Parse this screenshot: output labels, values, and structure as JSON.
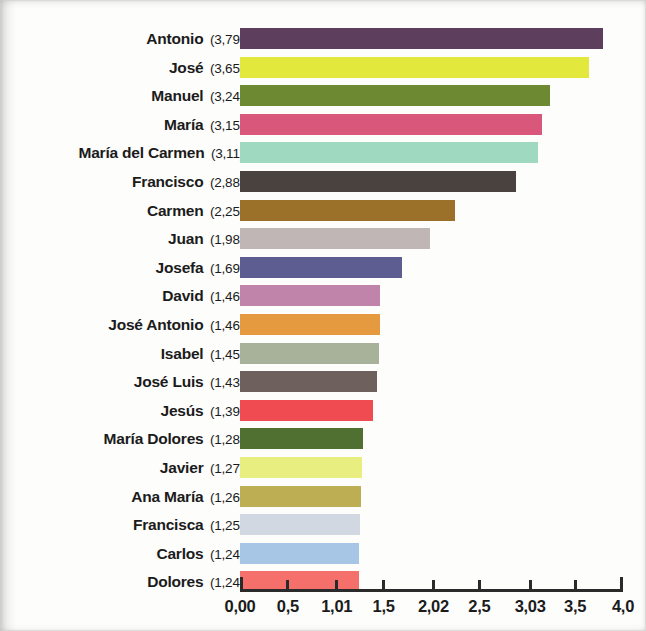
{
  "chart_data": {
    "type": "bar",
    "orientation": "horizontal",
    "title": "",
    "subtitle": "",
    "xlabel": "",
    "ylabel": "",
    "xlim": [
      0,
      4.0
    ],
    "grid": false,
    "legend": false,
    "decimal_separator": ",",
    "axis": {
      "tick_values": [
        0,
        0.5,
        1.01,
        1.5,
        2.02,
        2.5,
        3.03,
        3.5,
        4.0
      ],
      "tick_labels": [
        "0,00",
        "0,5",
        "1,01",
        "1,5",
        "2,02",
        "2,5",
        "3,03",
        "3,5",
        "4,0"
      ]
    },
    "categories": [
      "Antonio",
      "José",
      "Manuel",
      "María",
      "María del Carmen",
      "Francisco",
      "Carmen",
      "Juan",
      "Josefa",
      "David",
      "José Antonio",
      "Isabel",
      "José Luis",
      "Jesús",
      "María Dolores",
      "Javier",
      "Ana María",
      "Francisca",
      "Carlos",
      "Dolores"
    ],
    "values": [
      3.79,
      3.65,
      3.24,
      3.15,
      3.11,
      2.88,
      2.25,
      1.98,
      1.69,
      1.46,
      1.46,
      1.45,
      1.43,
      1.39,
      1.28,
      1.27,
      1.26,
      1.25,
      1.24,
      1.24
    ],
    "value_labels": [
      "3,79",
      "3,65",
      "3,24",
      "3,15",
      "3,11",
      "2,88",
      "2,25",
      "1,98",
      "1,69",
      "1,46",
      "1,46",
      "1,45",
      "1,43",
      "1,39",
      "1,28",
      "1,27",
      "1,26",
      "1,25",
      "1,24",
      "1,24"
    ],
    "colors": [
      "#5d3f5d",
      "#e2e83c",
      "#6d8a33",
      "#d8577a",
      "#9ed9c0",
      "#4a423e",
      "#9b7028",
      "#c0b6b6",
      "#5d5d91",
      "#c084aa",
      "#e59a3f",
      "#a8b29a",
      "#6e605c",
      "#ef4b51",
      "#4f7030",
      "#e8ee80",
      "#bdae53",
      "#d2d8e2",
      "#a7c6e6",
      "#f5706a"
    ],
    "rows": [
      {
        "name": "Antonio",
        "value": 3.79,
        "value_label": "3,79",
        "color": "#5d3f5d"
      },
      {
        "name": "José",
        "value": 3.65,
        "value_label": "3,65",
        "color": "#e2e83c"
      },
      {
        "name": "Manuel",
        "value": 3.24,
        "value_label": "3,24",
        "color": "#6d8a33"
      },
      {
        "name": "María",
        "value": 3.15,
        "value_label": "3,15",
        "color": "#d8577a"
      },
      {
        "name": "María del Carmen",
        "value": 3.11,
        "value_label": "3,11",
        "color": "#9ed9c0"
      },
      {
        "name": "Francisco",
        "value": 2.88,
        "value_label": "2,88",
        "color": "#4a423e"
      },
      {
        "name": "Carmen",
        "value": 2.25,
        "value_label": "2,25",
        "color": "#9b7028"
      },
      {
        "name": "Juan",
        "value": 1.98,
        "value_label": "1,98",
        "color": "#c0b6b6"
      },
      {
        "name": "Josefa",
        "value": 1.69,
        "value_label": "1,69",
        "color": "#5d5d91"
      },
      {
        "name": "David",
        "value": 1.46,
        "value_label": "1,46",
        "color": "#c084aa"
      },
      {
        "name": "José Antonio",
        "value": 1.46,
        "value_label": "1,46",
        "color": "#e59a3f"
      },
      {
        "name": "Isabel",
        "value": 1.45,
        "value_label": "1,45",
        "color": "#a8b29a"
      },
      {
        "name": "José Luis",
        "value": 1.43,
        "value_label": "1,43",
        "color": "#6e605c"
      },
      {
        "name": "Jesús",
        "value": 1.39,
        "value_label": "1,39",
        "color": "#ef4b51"
      },
      {
        "name": "María Dolores",
        "value": 1.28,
        "value_label": "1,28",
        "color": "#4f7030"
      },
      {
        "name": "Javier",
        "value": 1.27,
        "value_label": "1,27",
        "color": "#e8ee80"
      },
      {
        "name": "Ana María",
        "value": 1.26,
        "value_label": "1,26",
        "color": "#bdae53"
      },
      {
        "name": "Francisca",
        "value": 1.25,
        "value_label": "1,25",
        "color": "#d2d8e2"
      },
      {
        "name": "Carlos",
        "value": 1.24,
        "value_label": "1,24",
        "color": "#a7c6e6"
      },
      {
        "name": "Dolores",
        "value": 1.24,
        "value_label": "1,24",
        "color": "#f5706a"
      }
    ]
  },
  "layout": {
    "plot_left_px": 240,
    "plot_right_px": 623,
    "first_row_top_px": 27,
    "row_pitch_px": 28.6,
    "bar_height_px": 21,
    "axis_top_px": 589
  }
}
